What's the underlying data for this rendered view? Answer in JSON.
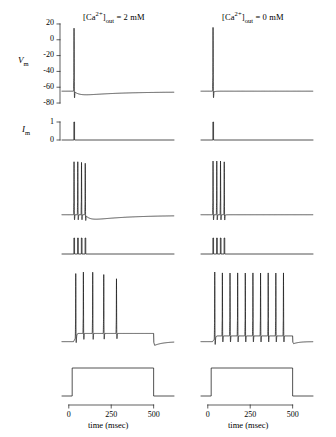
{
  "figure": {
    "width": 336,
    "height": 437,
    "background": "#ffffff",
    "trace_color": "#1a1a1a",
    "axis_color": "#1a1a1a"
  },
  "columns": [
    {
      "id": "left",
      "title_prefix": "[Ca",
      "title_sup": "2+",
      "title_mid": "]",
      "title_sub": "out",
      "title_suffix": " = 2 mM",
      "title_full": "[Ca2+]out = 2 mM"
    },
    {
      "id": "right",
      "title_prefix": "[Ca",
      "title_sup": "2+",
      "title_mid": "]",
      "title_sub": "out",
      "title_suffix": " = 0 mM",
      "title_full": "[Ca2+]out = 0 mM"
    }
  ],
  "axes": {
    "vm_label": "V",
    "vm_label_sub": "m",
    "vm_ticks": [
      "20",
      "0",
      "-20",
      "-40",
      "-60",
      "-80"
    ],
    "vm_tick_values": [
      20,
      0,
      -20,
      -40,
      -60,
      -80
    ],
    "vm_range": [
      -85,
      25
    ],
    "im_label": "I",
    "im_label_sub": "m",
    "im_ticks": [
      "1",
      "0"
    ],
    "im_tick_values": [
      1,
      0
    ],
    "x_ticks": [
      "0",
      "250",
      "500"
    ],
    "x_tick_values": [
      0,
      250,
      500
    ],
    "x_label": "time (msec)",
    "x_range": [
      -40,
      620
    ]
  },
  "chart_data": {
    "type": "line",
    "xlabel": "time (msec)",
    "ylabel": "Vm",
    "grid": false,
    "legend": "none",
    "rows": [
      {
        "row": 1,
        "kind": "vm",
        "description": "single action potential",
        "panels": [
          {
            "column": "left",
            "resting_mv": -65,
            "spike_times_ms": [
              30
            ],
            "spike_peaks_mv": [
              15
            ],
            "ahp": {
              "present": true,
              "depth_mv": -72,
              "trough_ms": 95,
              "decay_ms": 230
            },
            "final_mv": -66
          },
          {
            "column": "right",
            "resting_mv": -65,
            "spike_times_ms": [
              30
            ],
            "spike_peaks_mv": [
              16
            ],
            "ahp": {
              "present": false,
              "depth_mv": -67,
              "trough_ms": 45,
              "decay_ms": 40
            },
            "final_mv": -65
          }
        ]
      },
      {
        "row": 2,
        "kind": "im",
        "description": "brief stimulus current pulse",
        "panels": [
          {
            "column": "left",
            "pulse_times_ms": [
              30
            ],
            "pulse_amplitude": 1,
            "pulse_width_ms": 4,
            "baseline": 0
          },
          {
            "column": "right",
            "pulse_times_ms": [
              30
            ],
            "pulse_amplitude": 1,
            "pulse_width_ms": 4,
            "baseline": 0
          }
        ]
      },
      {
        "row": 3,
        "kind": "vm",
        "description": "burst of four action potentials",
        "panels": [
          {
            "column": "left",
            "resting_mv": -65,
            "spike_times_ms": [
              30,
              52,
              74,
              96
            ],
            "spike_peaks_mv": [
              15,
              15,
              14,
              13
            ],
            "ahp": {
              "present": true,
              "depth_mv": -75,
              "trough_ms": 150,
              "decay_ms": 300
            },
            "final_mv": -66
          },
          {
            "column": "right",
            "resting_mv": -65,
            "spike_times_ms": [
              30,
              52,
              74,
              96
            ],
            "spike_peaks_mv": [
              16,
              16,
              16,
              15
            ],
            "ahp": {
              "present": false,
              "depth_mv": -67,
              "trough_ms": 115,
              "decay_ms": 50
            },
            "final_mv": -65
          }
        ]
      },
      {
        "row": 4,
        "kind": "im",
        "description": "train of four brief stimulus pulses",
        "panels": [
          {
            "column": "left",
            "pulse_times_ms": [
              30,
              52,
              74,
              96
            ],
            "pulse_amplitude": 1,
            "pulse_width_ms": 4,
            "baseline": 0
          },
          {
            "column": "right",
            "pulse_times_ms": [
              30,
              52,
              74,
              96
            ],
            "pulse_amplitude": 1,
            "pulse_width_ms": 4,
            "baseline": 0
          }
        ]
      },
      {
        "row": 5,
        "kind": "vm",
        "description": "response to long depolarizing current step",
        "panels": [
          {
            "column": "left",
            "adaptation": true,
            "resting_mv": -65,
            "spike_times_ms": [
              40,
              85,
              140,
              205,
              280
            ],
            "spike_peaks_mv": [
              18,
              20,
              20,
              17,
              12
            ],
            "plateau_mv": -55,
            "step_end_ms": 500,
            "ahp": {
              "present": true,
              "depth_mv": -70,
              "trough_ms": 530,
              "decay_ms": 600
            },
            "final_mv": -65
          },
          {
            "column": "right",
            "adaptation": false,
            "resting_mv": -65,
            "spike_times_ms": [
              40,
              85,
              130,
              175,
              220,
              265,
              310,
              355,
              400,
              445
            ],
            "spike_peaks_mv": [
              20,
              19,
              19,
              19,
              19,
              19,
              19,
              19,
              19,
              19
            ],
            "plateau_mv": -58,
            "step_end_ms": 500,
            "ahp": {
              "present": false,
              "depth_mv": -68,
              "trough_ms": 520,
              "decay_ms": 560
            },
            "final_mv": -65
          }
        ]
      },
      {
        "row": 6,
        "kind": "im",
        "description": "long depolarizing current step",
        "panels": [
          {
            "column": "left",
            "step_start_ms": 20,
            "step_end_ms": 500,
            "step_amplitude": 1,
            "baseline": 0
          },
          {
            "column": "right",
            "step_start_ms": 20,
            "step_end_ms": 500,
            "step_amplitude": 1,
            "baseline": 0
          }
        ]
      }
    ]
  }
}
